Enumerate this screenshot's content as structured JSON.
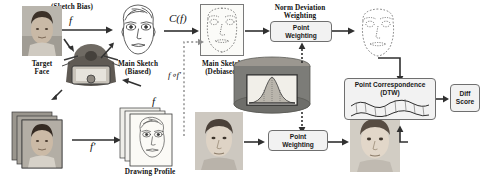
{
  "diagram": {
    "labels": {
      "sketch_bias": "(Sketch Bias)",
      "target_face": "Target\nFace",
      "target_face_l1": "Target",
      "target_face_l2": "Face",
      "main_sketch_biased_l1": "Main Sketch",
      "main_sketch_biased_l2": "(Biased)",
      "main_sketch_debiased_l1": "Main Sketch",
      "main_sketch_debiased_l2": "(Debiased)",
      "drawing_profile": "Drawing Profile",
      "norm_deviation_l1": "Norm Deviation",
      "norm_deviation_l2": "Weighting",
      "point_weighting_top_l1": "Point",
      "point_weighting_top_l2": "Weighting",
      "point_weighting_bottom_l1": "Point",
      "point_weighting_bottom_l2": "Weighting",
      "point_correspondence_l1": "Point Correspondence",
      "point_correspondence_l2": "(DTW)",
      "diff_score_l1": "Diff",
      "diff_score_l2": "Score"
    },
    "math": {
      "f_top": "f",
      "f_prime_bottom": "f'",
      "c_of_f": "C(f)",
      "f_comp_f_prime": "f∘f'"
    },
    "icons": {
      "target_face_photo": "photo-portrait-icon",
      "sketch_artist": "sketch-artist-illustration-icon",
      "main_sketch_biased": "face-sketch-drawing-icon",
      "main_sketch_debiased": "face-landmark-outline-icon",
      "right_face_landmarks": "face-landmark-outline-icon",
      "profile_photo_stack": "photo-stack-icon",
      "profile_sketch_stack": "sketch-stack-icon",
      "database_cylinder": "database-cylinder-icon",
      "bell_curve": "normal-distribution-curve-icon",
      "probe_photo_bottom": "photo-portrait-icon",
      "probe_photo_right": "photo-portrait-icon",
      "dtw_curves": "dtw-alignment-curves-icon"
    },
    "colors": {
      "arrow": "#303030",
      "box_border": "#6f6f6f",
      "box_fill": "#f2f2f2",
      "cylinder": "#7c7c78",
      "text": "#121212",
      "background": "#ffffff"
    }
  }
}
